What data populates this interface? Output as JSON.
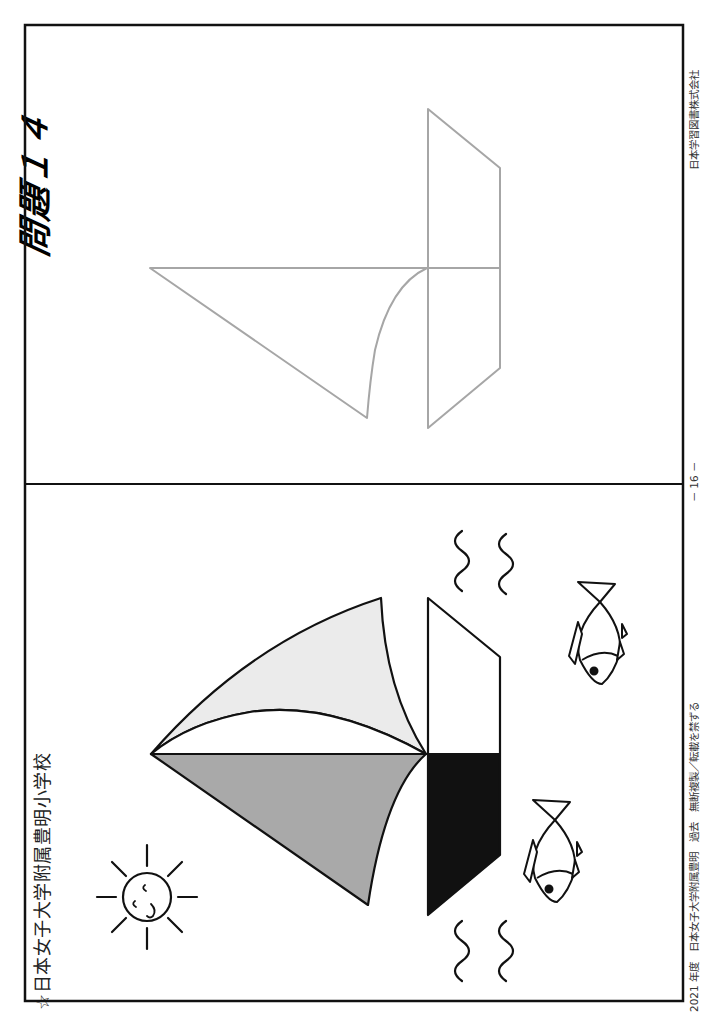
{
  "header": {
    "school_name": "☆日本女子大学附属豊明小学校",
    "problem_title": "問題１４"
  },
  "footer": {
    "left": "2021 年度　日本女子大学附属豊明　過去　無断複製／転載を禁ずる",
    "page": "－ 16 －",
    "publisher": "日本学習図書株式会社"
  },
  "panels": [
    {
      "name": "model-picture",
      "contents": [
        "sailboat with light-gray upper sail, gray lower sail, hull half black",
        "sun with smiling face",
        "two fish",
        "four wavy lines"
      ],
      "colors": {
        "light_sail": "#ebebeb",
        "dark_sail": "#a9a9a9",
        "hull_dark": "#111111",
        "outline": "#111111"
      }
    },
    {
      "name": "answer-outline",
      "contents": [
        "gray outline of sailboat to be colored"
      ],
      "colors": {
        "outline": "#a6a6a6"
      }
    }
  ]
}
